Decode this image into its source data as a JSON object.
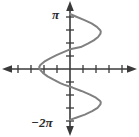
{
  "figure": {
    "name": "sine-curve-graph",
    "background_color": "#ffffff",
    "width": 139,
    "height": 137
  },
  "axes": {
    "axis_color": "#3a3a3a",
    "x_axis_name": "x-axis",
    "y_axis_name": "y-axis",
    "arrowheads": [
      "left",
      "right",
      "up",
      "down"
    ],
    "origin_px": [
      70,
      69
    ],
    "x_tick_count_left": 5,
    "x_tick_count_right": 4,
    "y_tick_count_up": 4,
    "y_tick_count_down": 4,
    "tick_spacing_px": 13,
    "labels": {
      "top": "π",
      "bottom": "−2π"
    }
  },
  "chart_data": {
    "type": "line",
    "title": "",
    "xlabel": "",
    "ylabel": "",
    "curve_color": "#808080",
    "curve_width_px": 2,
    "orientation": "horizontal-sinusoid",
    "xlim": [
      -5.4,
      5.3
    ],
    "ylim": [
      -6.2831853,
      3.1415927
    ],
    "y_tick_labels": [
      "π",
      "−2π"
    ],
    "y_tick_values": [
      3.1415927,
      -6.2831853
    ],
    "x_tick_labels": [],
    "grid": false,
    "legend": null,
    "series": [
      {
        "name": "x = sin(y) style curve",
        "parametric_variable": "y",
        "y": [
          3.1416,
          2.9,
          2.6,
          2.3,
          2.0,
          1.7,
          1.5708,
          1.4,
          1.1,
          0.8,
          0.5,
          0.2,
          0.0,
          -0.2,
          -0.5,
          -0.8,
          -1.1,
          -1.4,
          -1.5708,
          -1.8,
          -2.1,
          -2.4,
          -2.7,
          -3.0,
          -3.1416,
          -3.4,
          -3.7,
          -4.0,
          -4.3,
          -4.6,
          -4.7124,
          -4.9,
          -5.2,
          -5.5,
          -5.8,
          -6.1,
          -6.2832
        ],
        "x": [
          0.0,
          0.79,
          1.79,
          2.66,
          3.32,
          3.73,
          3.8,
          3.76,
          3.47,
          2.93,
          2.2,
          1.33,
          0.0,
          -0.66,
          -1.6,
          -2.46,
          -3.18,
          -3.66,
          -3.8,
          -3.7,
          -3.34,
          -2.77,
          -2.03,
          -1.2,
          -0.75,
          0.32,
          1.4,
          2.4,
          3.2,
          3.72,
          3.8,
          3.75,
          3.4,
          2.74,
          1.83,
          0.66,
          0.0
        ]
      }
    ]
  }
}
